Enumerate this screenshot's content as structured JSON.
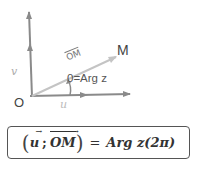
{
  "diagram": {
    "point_M": "M",
    "origin": "O",
    "angle_label": "0=Arg z",
    "vector_OM": "OM",
    "vector_u": "u",
    "vector_v": "v"
  },
  "formula": {
    "left_paren": "(",
    "u": "u",
    "separator": ";",
    "OM": "OM",
    "right_paren": ")",
    "equals": "=",
    "rhs": "Arg z(2π)"
  },
  "colors": {
    "axis": "#888888",
    "vector_OM": "#bdbdbd",
    "text": "#444444",
    "border": "#555555"
  }
}
